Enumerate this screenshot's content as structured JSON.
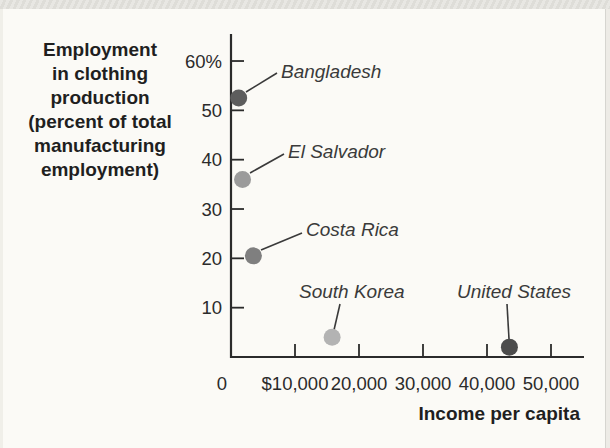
{
  "page": {
    "background": "#fbfaf6",
    "top_strip_color": "#e3e2de",
    "edge_line_color": "#d6d5d0"
  },
  "chart_data": {
    "type": "scatter",
    "title": "",
    "xlabel": "Income per capita",
    "ylabel": "Employment in clothing production (percent of total manufacturing employment)",
    "ylabel_lines": [
      "Employment",
      "in clothing",
      "production",
      "(percent of total",
      "manufacturing",
      "employment)"
    ],
    "xlim": [
      0,
      55000
    ],
    "ylim": [
      0,
      63
    ],
    "grid": false,
    "legend": "none",
    "ink_color": "#2b2b2b",
    "x_ticks": [
      {
        "value": 0,
        "label": "0"
      },
      {
        "value": 10000,
        "label": "$10,000"
      },
      {
        "value": 20000,
        "label": "20,000"
      },
      {
        "value": 30000,
        "label": "30,000"
      },
      {
        "value": 40000,
        "label": "40,000"
      },
      {
        "value": 50000,
        "label": "50,000"
      }
    ],
    "y_ticks": [
      {
        "value": 10,
        "label": "10"
      },
      {
        "value": 20,
        "label": "20"
      },
      {
        "value": 30,
        "label": "30"
      },
      {
        "value": 40,
        "label": "40"
      },
      {
        "value": 50,
        "label": "50"
      },
      {
        "value": 60,
        "label": "60%"
      }
    ],
    "points": [
      {
        "name": "Bangladesh",
        "x": 1200,
        "y": 52.5,
        "color": "#5d5d5d",
        "label_pos": {
          "x": 281,
          "y": 78
        },
        "leader": {
          "x1": 246,
          "y1": 92,
          "x2": 277,
          "y2": 73
        }
      },
      {
        "name": "El Salvador",
        "x": 1800,
        "y": 36,
        "color": "#9b9b9b",
        "label_pos": {
          "x": 288,
          "y": 158
        },
        "leader": {
          "x1": 250,
          "y1": 173,
          "x2": 284,
          "y2": 154
        }
      },
      {
        "name": "Costa Rica",
        "x": 3500,
        "y": 20.5,
        "color": "#7f7f7f",
        "label_pos": {
          "x": 306,
          "y": 236
        },
        "leader": {
          "x1": 261,
          "y1": 250,
          "x2": 302,
          "y2": 233
        }
      },
      {
        "name": "South Korea",
        "x": 15800,
        "y": 4,
        "color": "#b3b3b3",
        "label_pos": {
          "x": 299,
          "y": 298
        },
        "leader": {
          "x1": 340,
          "y1": 304,
          "x2": 334,
          "y2": 330
        }
      },
      {
        "name": "United States",
        "x": 43500,
        "y": 2,
        "color": "#4c4c4c",
        "label_pos": {
          "x": 457,
          "y": 298
        },
        "leader": {
          "x1": 507,
          "y1": 304,
          "x2": 509,
          "y2": 339
        }
      }
    ]
  }
}
